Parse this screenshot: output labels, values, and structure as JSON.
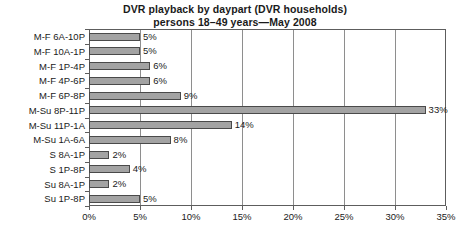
{
  "chart_data": {
    "type": "bar",
    "orientation": "horizontal",
    "title": "DVR playback by daypart (DVR households)\npersons 18–49 years—May 2008",
    "title_lines": [
      "DVR playback by daypart (DVR households)",
      "persons 18–49 years—May 2008"
    ],
    "xlabel": "",
    "ylabel": "",
    "categories": [
      "M-F 6A-10P",
      "M-F 10A-1P",
      "M-F 1P-4P",
      "M-F 4P-6P",
      "M-F 6P-8P",
      "M-Su 8P-11P",
      "M-Su 11P-1A",
      "M-Su 1A-6A",
      "S 8A-1P",
      "S 1P-8P",
      "Su 8A-1P",
      "Su 1P-8P"
    ],
    "values": [
      5,
      5,
      6,
      6,
      9,
      33,
      14,
      8,
      2,
      4,
      2,
      5
    ],
    "data_labels": [
      "5%",
      "5%",
      "6%",
      "6%",
      "9%",
      "33%",
      "14%",
      "8%",
      "2%",
      "4%",
      "2%",
      "5%"
    ],
    "xlim": [
      0,
      35
    ],
    "xticks": [
      0,
      5,
      10,
      15,
      20,
      25,
      30,
      35
    ],
    "xtick_labels": [
      "0%",
      "5%",
      "10%",
      "15%",
      "20%",
      "25%",
      "30%",
      "35%"
    ],
    "grid": "vertical",
    "legend": null,
    "bar_fill_color": "#a3a3a3",
    "bar_border_color": "#4a4a4a",
    "frame_color": "#5d5d5d",
    "gridline_color": "#8e8e8e",
    "background_color": "#ffffff"
  }
}
